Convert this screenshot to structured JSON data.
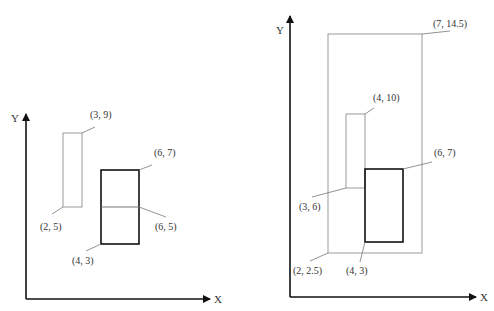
{
  "colors": {
    "axis": "#111111",
    "thin_rect": "#9a9a9a",
    "thick_rect": "#111111",
    "leader": "#777777",
    "text": "#333333"
  },
  "left_diagram": {
    "axis_labels": {
      "x": "X",
      "y": "Y"
    },
    "rects": [
      {
        "name": "thin-rect",
        "style": "thin",
        "lower_left": "(2, 5)",
        "upper_right": "(3, 9)"
      },
      {
        "name": "thick-rect",
        "style": "thick",
        "lower_left": "(4, 3)",
        "upper_right": "(6, 7)",
        "midline_label": "(6, 5)"
      }
    ],
    "labels": {
      "p39": "(3, 9)",
      "p25": "(2, 5)",
      "p67": "(6, 7)",
      "p65": "(6, 5)",
      "p43": "(4, 3)"
    }
  },
  "right_diagram": {
    "axis_labels": {
      "x": "X",
      "y": "Y"
    },
    "rects": [
      {
        "name": "bounding-rect",
        "style": "thin",
        "lower_left": "(2, 2.5)",
        "upper_right": "(7, 14.5)"
      },
      {
        "name": "thin-rect",
        "style": "thin",
        "lower_left": "(3, 6)",
        "upper_right": "(4, 10)"
      },
      {
        "name": "thick-rect",
        "style": "thick",
        "lower_left": "(4, 3)",
        "upper_right": "(6, 7)"
      }
    ],
    "labels": {
      "p7145": "(7, 14.5)",
      "p410": "(4, 10)",
      "p67": "(6, 7)",
      "p36": "(3, 6)",
      "p225": "(2, 2.5)",
      "p43": "(4, 3)"
    }
  }
}
